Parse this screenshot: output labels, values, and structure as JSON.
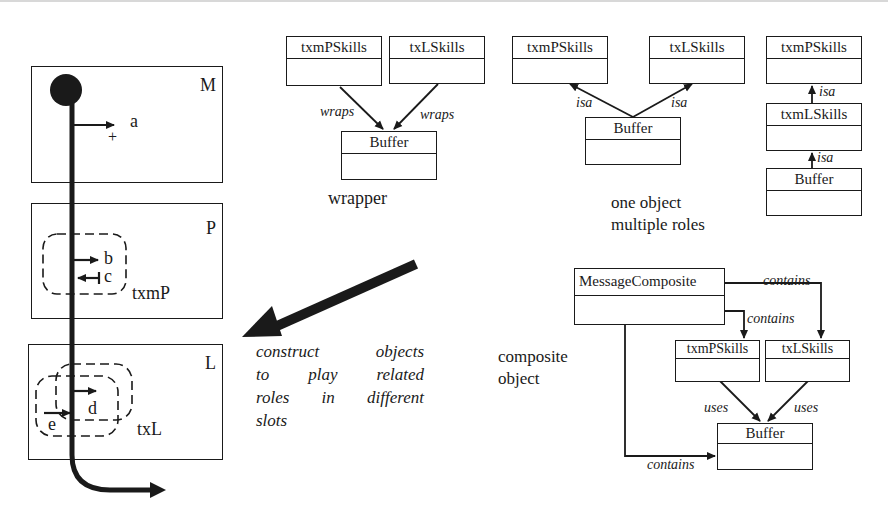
{
  "figure": {
    "slots": [
      {
        "letter": "M"
      },
      {
        "letter": "P",
        "role": "txmP"
      },
      {
        "letter": "L",
        "role": "txL"
      }
    ],
    "path_labels": {
      "a": "a",
      "plus": "+",
      "b": "b",
      "c": "c",
      "d": "d",
      "e": "e"
    },
    "note": {
      "lines": [
        "construct objects",
        "to play related",
        "roles in different",
        "slots"
      ]
    },
    "patterns": {
      "wrapper": {
        "caption": "wrapper",
        "classes": [
          "txmPSkills",
          "txLSkills",
          "Buffer"
        ],
        "edge_label": "wraps"
      },
      "one_object_multiple_roles": {
        "caption_lines": [
          "one object",
          "multiple roles"
        ],
        "classes": [
          "txmPSkills",
          "txLSkills",
          "Buffer"
        ],
        "edge_label": "isa"
      },
      "inheritance_chain": {
        "classes": [
          "txmPSkills",
          "txmLSkills",
          "Buffer"
        ],
        "edge_label": "isa"
      },
      "composite": {
        "caption_lines": [
          "composite",
          "object"
        ],
        "classes": [
          "MessageComposite",
          "txmPSkills",
          "txLSkills",
          "Buffer"
        ],
        "contains_label": "contains",
        "uses_label": "uses"
      }
    },
    "colors": {
      "ink": "#1a1a1a",
      "background": "#ffffff"
    }
  }
}
